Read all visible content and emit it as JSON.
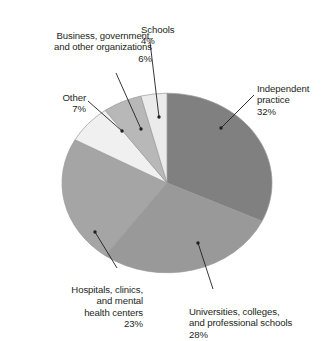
{
  "chart_data": {
    "type": "pie",
    "title": "",
    "title_note": "cut off at top edge of image",
    "categories": [
      "Independent practice",
      "Universities, colleges, and professional schools",
      "Hospitals, clinics, and mental health centers",
      "Other",
      "Business, government, and other organizations",
      "Schools"
    ],
    "values": [
      32,
      28,
      23,
      7,
      6,
      4
    ],
    "value_unit": "%",
    "legend": "none (direct labels with leader lines)",
    "start_angle_deg": 0,
    "direction": "clockwise",
    "colors": [
      "#808080",
      "#999999",
      "#a5a5a5",
      "#f0f0f0",
      "#b8b8b8",
      "#ebebeb"
    ],
    "slices": [
      {
        "key": "independent",
        "label": "Independent\npractice",
        "pct": "32%",
        "value": 32,
        "color": "#808080",
        "start_deg": 0,
        "end_deg": 115.2
      },
      {
        "key": "universities",
        "label": "Universities, colleges,\nand professional schools",
        "pct": "28%",
        "value": 28,
        "color": "#999999",
        "start_deg": 115.2,
        "end_deg": 216.0
      },
      {
        "key": "hospitals",
        "label": "Hospitals, clinics,\nand mental\nhealth centers",
        "pct": "23%",
        "value": 23,
        "color": "#a5a5a5",
        "start_deg": 216.0,
        "end_deg": 298.8
      },
      {
        "key": "other",
        "label": "Other",
        "pct": "7%",
        "value": 7,
        "color": "#f0f0f0",
        "start_deg": 298.8,
        "end_deg": 324.0
      },
      {
        "key": "business",
        "label": "Business, government,\nand other organizations",
        "pct": "6%",
        "value": 6,
        "color": "#b8b8b8",
        "start_deg": 324.0,
        "end_deg": 345.6
      },
      {
        "key": "schools",
        "label": "Schools",
        "pct": "4%",
        "value": 4,
        "color": "#ebebeb",
        "start_deg": 345.6,
        "end_deg": 360.0
      }
    ]
  },
  "geometry": {
    "cx": 167,
    "cy": 183,
    "r": 105,
    "stroke": "#9a9a9a",
    "leader_color": "#231f20"
  }
}
